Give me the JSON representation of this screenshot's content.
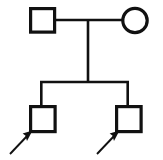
{
  "diagram": {
    "type": "pedigree",
    "background_color": "#ffffff",
    "line_color": "#111111",
    "symbol_fill_color": "#ffffff",
    "generations": 2,
    "individuals": [
      {
        "id": "I-1",
        "generation": 1,
        "shape": "square",
        "sex": "male",
        "affected": false,
        "fill": "unfilled",
        "proband": false,
        "label": "",
        "position": {
          "x": 29,
          "y": 7,
          "width": 26,
          "height": 26
        }
      },
      {
        "id": "I-2",
        "generation": 1,
        "shape": "circle",
        "sex": "female",
        "affected": false,
        "fill": "unfilled",
        "proband": false,
        "label": "",
        "position": {
          "cx": 135,
          "cy": 20,
          "r": 13
        }
      },
      {
        "id": "II-1",
        "generation": 2,
        "shape": "square",
        "sex": "male",
        "affected": false,
        "fill": "unfilled",
        "proband": true,
        "label": "",
        "position": {
          "x": 29,
          "y": 105,
          "width": 27,
          "height": 28
        }
      },
      {
        "id": "II-2",
        "generation": 2,
        "shape": "square",
        "sex": "male",
        "affected": false,
        "fill": "unfilled",
        "proband": true,
        "label": "",
        "position": {
          "x": 115,
          "y": 105,
          "width": 27,
          "height": 28
        }
      }
    ],
    "connections": [
      {
        "id": "mating-line",
        "type": "mating",
        "between": [
          "I-1",
          "I-2"
        ],
        "x1": 55,
        "y1": 20,
        "x2": 122,
        "y2": 20
      },
      {
        "id": "descent-line",
        "type": "descent",
        "from": "mating-line",
        "x1": 88,
        "y1": 20,
        "x2": 88,
        "y2": 82
      },
      {
        "id": "sibship-line",
        "type": "sibship",
        "children": [
          "II-1",
          "II-2"
        ],
        "x1": 40,
        "y1": 82,
        "x2": 129,
        "y2": 82
      },
      {
        "id": "drop-line-left",
        "type": "drop",
        "to": "II-1",
        "x1": 41,
        "y1": 82,
        "x2": 41,
        "y2": 105
      },
      {
        "id": "drop-line-right",
        "type": "drop",
        "to": "II-2",
        "x1": 128,
        "y1": 82,
        "x2": 128,
        "y2": 105
      }
    ],
    "arrows": [
      {
        "id": "proband-arrow-left",
        "points_to": "II-1",
        "direction": "up-right",
        "tail": {
          "x": 10,
          "y": 154
        },
        "tip": {
          "x": 32,
          "y": 131
        }
      },
      {
        "id": "proband-arrow-right",
        "points_to": "II-2",
        "direction": "up-right",
        "tail": {
          "x": 97,
          "y": 154
        },
        "tip": {
          "x": 119,
          "y": 131
        }
      }
    ]
  }
}
